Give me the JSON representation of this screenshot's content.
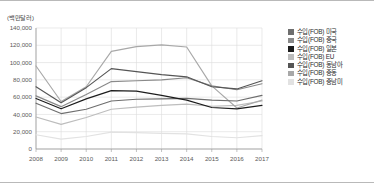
{
  "chart_data": {
    "type": "line",
    "title": "",
    "unit_label": "(백만달러)",
    "xlabel": "",
    "ylabel": "",
    "x": [
      2008,
      2009,
      2010,
      2011,
      2012,
      2013,
      2014,
      2015,
      2016,
      2017
    ],
    "xtick_labels": [
      "2008",
      "2009",
      "2010",
      "2011",
      "2012",
      "2013",
      "2014",
      "2015",
      "2016",
      "2017"
    ],
    "ylim": [
      0,
      140000
    ],
    "ytick_labels": [
      "0",
      "20,000",
      "40,000",
      "60,000",
      "80,000",
      "100,000",
      "120,000",
      "140,000"
    ],
    "ytick_values": [
      0,
      20000,
      40000,
      60000,
      80000,
      100000,
      120000,
      140000
    ],
    "grid": true,
    "legend_position": "right",
    "series": [
      {
        "name": "수입(FOB) 미국",
        "color": "#6e6e6e",
        "values": [
          53000,
          41000,
          46000,
          55500,
          57500,
          58000,
          58500,
          56500,
          55500,
          62000
        ]
      },
      {
        "name": "수입(FOB) 중국",
        "color": "#8a8a8a",
        "values": [
          61500,
          49000,
          63000,
          78000,
          79000,
          80000,
          82500,
          73000,
          68500,
          75500
        ]
      },
      {
        "name": "수입(FOB) 일본",
        "color": "#1c1c1c",
        "values": [
          58500,
          46500,
          58000,
          67500,
          67000,
          62000,
          56500,
          48000,
          46500,
          50500
        ]
      },
      {
        "name": "수입(FOB) EU",
        "color": "#bdbdbd",
        "values": [
          37000,
          28500,
          36500,
          46000,
          48500,
          50500,
          52000,
          49500,
          50500,
          55500
        ]
      },
      {
        "name": "수입(FOB) 동남아",
        "color": "#555555",
        "values": [
          72000,
          53500,
          71000,
          93000,
          89500,
          86000,
          83500,
          72000,
          69500,
          79000
        ]
      },
      {
        "name": "수입(FOB) 중동",
        "color": "#a8a8a8",
        "values": [
          96000,
          55000,
          72000,
          113000,
          118500,
          120500,
          118000,
          73000,
          47500,
          56500
        ]
      },
      {
        "name": "수입(FOB) 중남미",
        "color": "#e2e2e2",
        "values": [
          16500,
          11500,
          14500,
          19500,
          19000,
          18000,
          17500,
          14500,
          13000,
          15500
        ]
      }
    ]
  }
}
